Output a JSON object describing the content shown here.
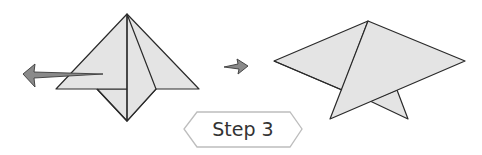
{
  "diagram": {
    "step_badge": {
      "label": "Step 3"
    },
    "figures": [
      {
        "name": "before-fold",
        "description": "Folded diamond shape with left arrow indicating pull direction"
      },
      {
        "name": "after-fold",
        "description": "Resulting flattened shape with small triangle tail"
      }
    ],
    "arrows": [
      {
        "name": "pull-left-arrow",
        "direction": "left"
      },
      {
        "name": "transition-arrow",
        "direction": "right"
      }
    ],
    "colors": {
      "paper": "#e4e4e4",
      "outline": "#2a2a2a",
      "arrow": "#8a8a8a",
      "badge_border": "#bdbdbd"
    }
  }
}
